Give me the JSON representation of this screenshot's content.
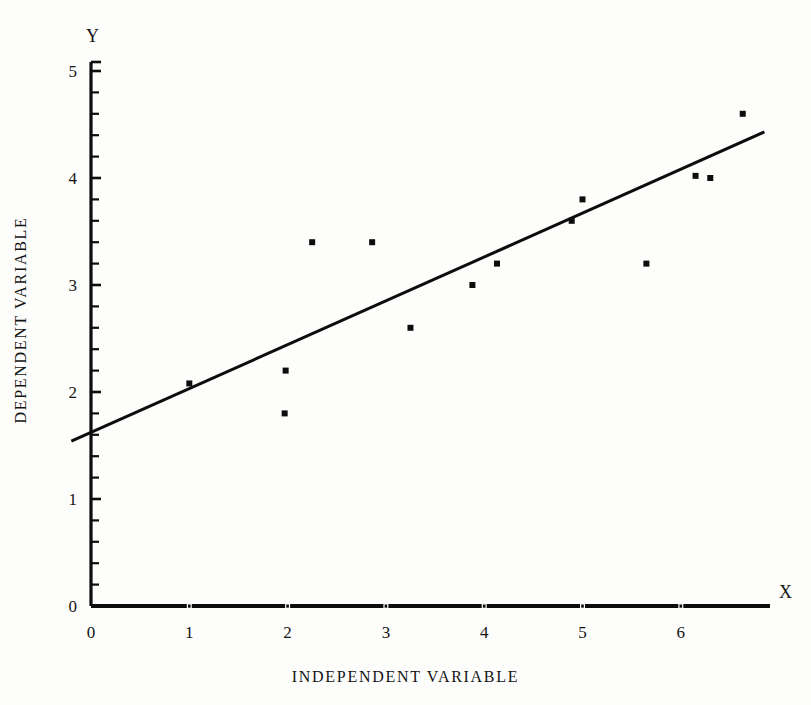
{
  "chart_data": {
    "type": "scatter",
    "title": "",
    "xlabel": "INDEPENDENT VARIABLE",
    "ylabel": "DEPENDENT VARIABLE",
    "x_axis_letter": "X",
    "y_axis_letter": "Y",
    "xlim": [
      0,
      7
    ],
    "ylim": [
      0,
      5
    ],
    "xticks": [
      0,
      1,
      2,
      3,
      4,
      5,
      6
    ],
    "xtick_labels": [
      "0",
      "1",
      "2",
      "3",
      "4",
      "5",
      "6"
    ],
    "yticks": [
      0,
      1,
      2,
      3,
      4,
      5
    ],
    "ytick_labels": [
      "0",
      "1",
      "2",
      "3",
      "4",
      "5"
    ],
    "y_minor_tick_step": 0.2,
    "grid": false,
    "legend": null,
    "marker": "square",
    "marker_size_px": 6,
    "marker_color": "#0d0d0d",
    "line_color": "#0d0d0d",
    "line_width_px": 3,
    "points": [
      {
        "x": 1.0,
        "y": 2.08
      },
      {
        "x": 1.97,
        "y": 1.8
      },
      {
        "x": 1.98,
        "y": 2.2
      },
      {
        "x": 2.25,
        "y": 3.4
      },
      {
        "x": 2.86,
        "y": 3.4
      },
      {
        "x": 3.25,
        "y": 2.6
      },
      {
        "x": 3.88,
        "y": 3.0
      },
      {
        "x": 4.13,
        "y": 3.2
      },
      {
        "x": 4.89,
        "y": 3.6
      },
      {
        "x": 5.0,
        "y": 3.8
      },
      {
        "x": 5.65,
        "y": 3.2
      },
      {
        "x": 6.15,
        "y": 4.02
      },
      {
        "x": 6.3,
        "y": 4.0
      },
      {
        "x": 6.63,
        "y": 4.6
      }
    ],
    "regression_line": {
      "x_start": -0.2,
      "y_start": 1.54,
      "x_end": 6.85,
      "y_end": 4.43,
      "slope": 0.41,
      "intercept": 1.62
    }
  },
  "axes_geometry": {
    "origin_px_x": 91,
    "origin_px_y": 606,
    "px_per_x_unit": 98.3,
    "px_per_y_unit": 107.0,
    "y_axis_top_px": 62,
    "x_axis_right_px": 770
  }
}
